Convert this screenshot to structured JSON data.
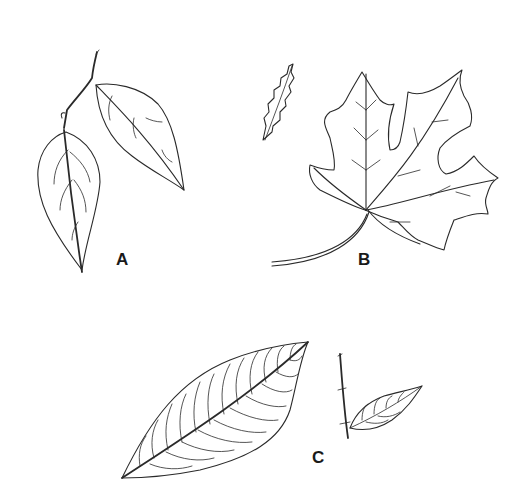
{
  "figure": {
    "background": "#ffffff",
    "line_color": "#2a2a2a",
    "panels": [
      {
        "id": "A",
        "label": "A",
        "subject": "two ovate leaves on a twig"
      },
      {
        "id": "B",
        "label": "B",
        "subject": "lobed maple-type leaf with small serrated leaf"
      },
      {
        "id": "C",
        "label": "C",
        "subject": "elliptic leaf with parallel lateral veins and twig with small leaf"
      }
    ]
  }
}
